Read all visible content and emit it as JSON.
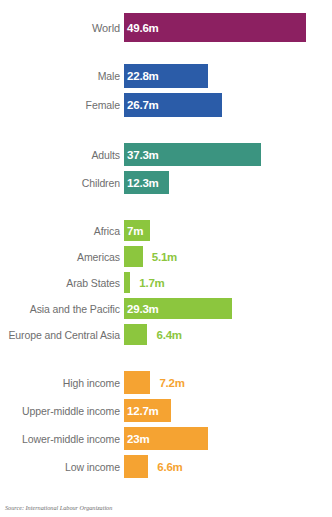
{
  "source_note": "Source: International Labour Organization",
  "colors": {
    "world": "#8C2061",
    "sex": "#2B5CA8",
    "age": "#3B9480",
    "region": "#8CC63E",
    "income": "#F5A332",
    "label_text": "#6E6E6E",
    "value_inside": "#FFFFFF",
    "background": "#FFFFFF"
  },
  "chart_data": {
    "type": "bar",
    "title": "",
    "subtitle": "",
    "xlabel": "",
    "ylabel": "",
    "orientation": "horizontal",
    "unit": "millions",
    "xlim": [
      0,
      49.6
    ],
    "grid": false,
    "legend": "none",
    "groups": [
      {
        "name": "world",
        "color": "#8C2061",
        "bars": [
          {
            "label": "World",
            "value": 49.6,
            "value_label": "49.6m",
            "label_inside": true
          }
        ]
      },
      {
        "name": "sex",
        "color": "#2B5CA8",
        "bars": [
          {
            "label": "Male",
            "value": 22.8,
            "value_label": "22.8m",
            "label_inside": true
          },
          {
            "label": "Female",
            "value": 26.7,
            "value_label": "26.7m",
            "label_inside": true
          }
        ]
      },
      {
        "name": "age",
        "color": "#3B9480",
        "bars": [
          {
            "label": "Adults",
            "value": 37.3,
            "value_label": "37.3m",
            "label_inside": true
          },
          {
            "label": "Children",
            "value": 12.3,
            "value_label": "12.3m",
            "label_inside": true
          }
        ]
      },
      {
        "name": "region",
        "color": "#8CC63E",
        "bars": [
          {
            "label": "Africa",
            "value": 7,
            "value_label": "7m",
            "label_inside": true
          },
          {
            "label": "Americas",
            "value": 5.1,
            "value_label": "5.1m",
            "label_inside": false
          },
          {
            "label": "Arab States",
            "value": 1.7,
            "value_label": "1.7m",
            "label_inside": false
          },
          {
            "label": "Asia and the Pacific",
            "value": 29.3,
            "value_label": "29.3m",
            "label_inside": true
          },
          {
            "label": "Europe and Central Asia",
            "value": 6.4,
            "value_label": "6.4m",
            "label_inside": false
          }
        ]
      },
      {
        "name": "income",
        "color": "#F5A332",
        "bars": [
          {
            "label": "High income",
            "value": 7.2,
            "value_label": "7.2m",
            "label_inside": false
          },
          {
            "label": "Upper-middle income",
            "value": 12.7,
            "value_label": "12.7m",
            "label_inside": true
          },
          {
            "label": "Lower-middle income",
            "value": 23,
            "value_label": "23m",
            "label_inside": true
          },
          {
            "label": "Low income",
            "value": 6.6,
            "value_label": "6.6m",
            "label_inside": false
          }
        ]
      }
    ]
  }
}
